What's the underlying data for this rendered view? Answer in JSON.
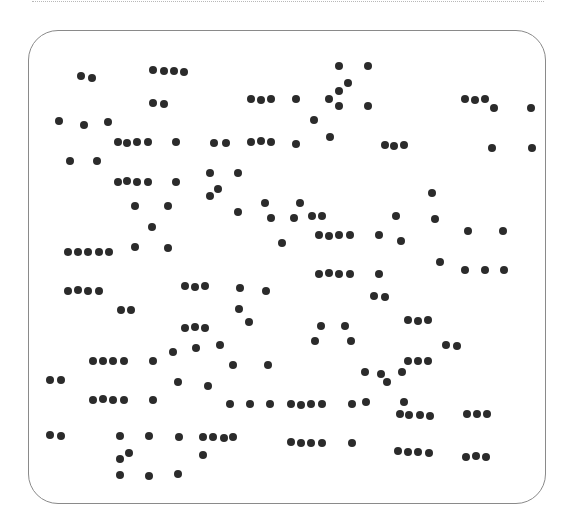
{
  "canvas": {
    "width": 575,
    "height": 532,
    "dot_color": "#2b2b2b",
    "frame_color": "#8a8a8a",
    "rule_color": "#b8b8b8"
  },
  "dots": [
    [
      81,
      76
    ],
    [
      92,
      78
    ],
    [
      153,
      70
    ],
    [
      164,
      71
    ],
    [
      174,
      71
    ],
    [
      184,
      72
    ],
    [
      153,
      103
    ],
    [
      164,
      104
    ],
    [
      59,
      121
    ],
    [
      84,
      125
    ],
    [
      108,
      122
    ],
    [
      118,
      142
    ],
    [
      127,
      143
    ],
    [
      137,
      142
    ],
    [
      148,
      142
    ],
    [
      176,
      142
    ],
    [
      70,
      161
    ],
    [
      97,
      161
    ],
    [
      118,
      182
    ],
    [
      127,
      181
    ],
    [
      137,
      182
    ],
    [
      148,
      182
    ],
    [
      176,
      182
    ],
    [
      339,
      66
    ],
    [
      368,
      66
    ],
    [
      348,
      83
    ],
    [
      339,
      91
    ],
    [
      251,
      99
    ],
    [
      261,
      100
    ],
    [
      271,
      99
    ],
    [
      296,
      99
    ],
    [
      329,
      99
    ],
    [
      339,
      106
    ],
    [
      368,
      106
    ],
    [
      314,
      120
    ],
    [
      330,
      137
    ],
    [
      214,
      143
    ],
    [
      226,
      143
    ],
    [
      251,
      142
    ],
    [
      261,
      141
    ],
    [
      271,
      142
    ],
    [
      296,
      144
    ],
    [
      465,
      99
    ],
    [
      475,
      100
    ],
    [
      485,
      99
    ],
    [
      494,
      108
    ],
    [
      531,
      108
    ],
    [
      385,
      145
    ],
    [
      394,
      146
    ],
    [
      404,
      145
    ],
    [
      492,
      148
    ],
    [
      532,
      148
    ],
    [
      210,
      173
    ],
    [
      238,
      173
    ],
    [
      218,
      189
    ],
    [
      210,
      196
    ],
    [
      238,
      212
    ],
    [
      135,
      206
    ],
    [
      168,
      206
    ],
    [
      152,
      227
    ],
    [
      135,
      247
    ],
    [
      168,
      248
    ],
    [
      265,
      203
    ],
    [
      300,
      203
    ],
    [
      271,
      218
    ],
    [
      294,
      218
    ],
    [
      312,
      216
    ],
    [
      322,
      216
    ],
    [
      282,
      243
    ],
    [
      319,
      235
    ],
    [
      329,
      236
    ],
    [
      339,
      235
    ],
    [
      350,
      235
    ],
    [
      379,
      235
    ],
    [
      432,
      193
    ],
    [
      396,
      216
    ],
    [
      435,
      219
    ],
    [
      401,
      241
    ],
    [
      468,
      231
    ],
    [
      503,
      231
    ],
    [
      440,
      262
    ],
    [
      465,
      270
    ],
    [
      485,
      270
    ],
    [
      504,
      270
    ],
    [
      68,
      252
    ],
    [
      78,
      252
    ],
    [
      88,
      252
    ],
    [
      99,
      252
    ],
    [
      109,
      252
    ],
    [
      319,
      274
    ],
    [
      329,
      273
    ],
    [
      339,
      274
    ],
    [
      350,
      274
    ],
    [
      379,
      274
    ],
    [
      374,
      296
    ],
    [
      385,
      297
    ],
    [
      68,
      291
    ],
    [
      78,
      290
    ],
    [
      88,
      291
    ],
    [
      99,
      291
    ],
    [
      185,
      286
    ],
    [
      195,
      287
    ],
    [
      205,
      286
    ],
    [
      240,
      288
    ],
    [
      266,
      291
    ],
    [
      121,
      310
    ],
    [
      131,
      310
    ],
    [
      239,
      309
    ],
    [
      249,
      322
    ],
    [
      408,
      320
    ],
    [
      418,
      321
    ],
    [
      428,
      320
    ],
    [
      185,
      328
    ],
    [
      195,
      327
    ],
    [
      205,
      328
    ],
    [
      321,
      326
    ],
    [
      345,
      326
    ],
    [
      315,
      341
    ],
    [
      351,
      341
    ],
    [
      446,
      345
    ],
    [
      457,
      346
    ],
    [
      220,
      345
    ],
    [
      173,
      352
    ],
    [
      196,
      348
    ],
    [
      93,
      361
    ],
    [
      103,
      361
    ],
    [
      113,
      361
    ],
    [
      124,
      361
    ],
    [
      153,
      361
    ],
    [
      408,
      361
    ],
    [
      418,
      361
    ],
    [
      428,
      361
    ],
    [
      50,
      380
    ],
    [
      61,
      380
    ],
    [
      233,
      365
    ],
    [
      268,
      365
    ],
    [
      365,
      372
    ],
    [
      381,
      374
    ],
    [
      402,
      372
    ],
    [
      387,
      382
    ],
    [
      178,
      382
    ],
    [
      208,
      386
    ],
    [
      93,
      400
    ],
    [
      103,
      399
    ],
    [
      113,
      400
    ],
    [
      124,
      400
    ],
    [
      153,
      400
    ],
    [
      230,
      404
    ],
    [
      250,
      404
    ],
    [
      270,
      404
    ],
    [
      291,
      404
    ],
    [
      301,
      405
    ],
    [
      311,
      404
    ],
    [
      322,
      404
    ],
    [
      352,
      404
    ],
    [
      366,
      402
    ],
    [
      404,
      402
    ],
    [
      400,
      414
    ],
    [
      409,
      415
    ],
    [
      420,
      415
    ],
    [
      430,
      416
    ],
    [
      467,
      414
    ],
    [
      477,
      414
    ],
    [
      487,
      414
    ],
    [
      50,
      435
    ],
    [
      61,
      436
    ],
    [
      120,
      436
    ],
    [
      149,
      436
    ],
    [
      179,
      437
    ],
    [
      203,
      437
    ],
    [
      213,
      437
    ],
    [
      224,
      438
    ],
    [
      233,
      437
    ],
    [
      291,
      442
    ],
    [
      301,
      443
    ],
    [
      311,
      443
    ],
    [
      322,
      443
    ],
    [
      352,
      443
    ],
    [
      398,
      451
    ],
    [
      408,
      452
    ],
    [
      418,
      452
    ],
    [
      429,
      453
    ],
    [
      466,
      457
    ],
    [
      476,
      456
    ],
    [
      486,
      457
    ],
    [
      129,
      453
    ],
    [
      120,
      459
    ],
    [
      203,
      455
    ],
    [
      120,
      475
    ],
    [
      149,
      476
    ],
    [
      178,
      474
    ]
  ]
}
